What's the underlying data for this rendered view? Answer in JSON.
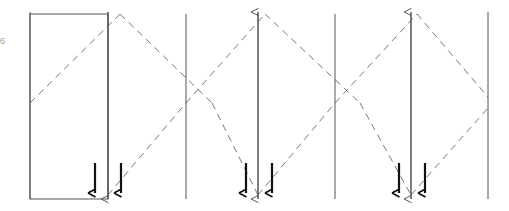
{
  "diagram": {
    "type": "line-diagram",
    "canvas": {
      "width": 509,
      "height": 211
    },
    "colors": {
      "solid_line": "#555555",
      "dashed_line": "#777777",
      "rectangle": "#555555",
      "marker": "#111111",
      "background": "#ffffff",
      "edge_label": "#9a9a9a"
    },
    "stroke_widths": {
      "solid_line": 1.0,
      "dashed_line": 1.0,
      "rectangle": 1.0,
      "marker": 2.2
    },
    "dash_pattern": "7,5",
    "edge_label_text": "6",
    "vertical_lines": [
      {
        "name": "plane-1",
        "x": 30,
        "y_top": 12,
        "y_bottom": 199,
        "arrow": "none"
      },
      {
        "name": "plane-2",
        "x": 108,
        "y_top": 12,
        "y_bottom": 199,
        "arrow": "none"
      },
      {
        "name": "plane-3",
        "x": 186,
        "y_top": 14,
        "y_bottom": 199,
        "arrow": "none"
      },
      {
        "name": "plane-4",
        "x": 258,
        "y_top": 12,
        "y_bottom": 199,
        "arrow": "up"
      },
      {
        "name": "plane-5",
        "x": 335,
        "y_top": 14,
        "y_bottom": 199,
        "arrow": "none"
      },
      {
        "name": "plane-6",
        "x": 411,
        "y_top": 12,
        "y_bottom": 199,
        "arrow": "up"
      },
      {
        "name": "plane-7",
        "x": 488,
        "y_top": 12,
        "y_bottom": 199,
        "arrow": "none"
      }
    ],
    "down_arrow_lines": [
      {
        "name": "down-plane-1",
        "x": 108,
        "y_top": 12,
        "y_bottom": 199
      },
      {
        "name": "down-plane-2",
        "x": 258,
        "y_top": 12,
        "y_bottom": 199
      },
      {
        "name": "down-plane-3",
        "x": 411,
        "y_top": 12,
        "y_bottom": 199
      }
    ],
    "rectangle": {
      "name": "left-block",
      "x": 30,
      "y": 14,
      "width": 78,
      "height": 185
    },
    "zigzag_path": {
      "name": "ray-path",
      "points": [
        {
          "x": 30,
          "y": 103
        },
        {
          "x": 120,
          "y": 14
        },
        {
          "x": 197,
          "y": 103
        },
        {
          "x": 258,
          "y": 199
        },
        {
          "x": 275,
          "y": 103
        },
        {
          "x": 335,
          "y": 103
        },
        {
          "x": 411,
          "y": 14
        },
        {
          "x": 488,
          "y": 103
        }
      ],
      "description": "Dashed rays forming repeating diamond crossings between planes"
    },
    "zigzag_segments": [
      {
        "name": "seg-up-1",
        "x1": 30,
        "y1": 103,
        "x2": 120,
        "y2": 14
      },
      {
        "name": "seg-down-1",
        "x1": 120,
        "y1": 14,
        "x2": 212,
        "y2": 103
      },
      {
        "name": "seg-down-1b",
        "x1": 212,
        "y1": 103,
        "x2": 258,
        "y2": 195
      },
      {
        "name": "seg-up-2",
        "x1": 108,
        "y1": 195,
        "x2": 186,
        "y2": 103
      },
      {
        "name": "seg-up-2b",
        "x1": 186,
        "y1": 103,
        "x2": 265,
        "y2": 14
      },
      {
        "name": "seg-down-2",
        "x1": 265,
        "y1": 14,
        "x2": 360,
        "y2": 103
      },
      {
        "name": "seg-down-2b",
        "x1": 360,
        "y1": 103,
        "x2": 411,
        "y2": 195
      },
      {
        "name": "seg-up-3",
        "x1": 258,
        "y1": 195,
        "x2": 335,
        "y2": 103
      },
      {
        "name": "seg-up-3b",
        "x1": 335,
        "y1": 103,
        "x2": 417,
        "y2": 14
      },
      {
        "name": "seg-down-3",
        "x1": 417,
        "y1": 14,
        "x2": 488,
        "y2": 97
      },
      {
        "name": "seg-up-4",
        "x1": 411,
        "y1": 195,
        "x2": 488,
        "y2": 108
      }
    ],
    "crossing_points": [
      {
        "name": "crossing-left",
        "x": 30,
        "y": 103
      },
      {
        "name": "crossing-mid-1",
        "x": 186,
        "y": 103
      },
      {
        "name": "crossing-mid-2",
        "x": 335,
        "y": 103
      },
      {
        "name": "crossing-right",
        "x": 488,
        "y": 103
      }
    ],
    "apex_points": [
      {
        "name": "apex-up-1",
        "x": 108,
        "y": 14,
        "direction": "up"
      },
      {
        "name": "apex-down-1",
        "x": 258,
        "y": 199,
        "direction": "down"
      },
      {
        "name": "apex-up-2",
        "x": 258,
        "y": 12,
        "direction": "up"
      },
      {
        "name": "apex-down-2",
        "x": 411,
        "y": 199,
        "direction": "down"
      },
      {
        "name": "apex-up-3",
        "x": 411,
        "y": 12,
        "direction": "up"
      }
    ],
    "tick_markers": [
      {
        "name": "tick-marker-1",
        "x": 95,
        "y_top": 163,
        "y_bottom": 193
      },
      {
        "name": "tick-marker-2",
        "x": 121,
        "y_top": 163,
        "y_bottom": 193
      },
      {
        "name": "tick-marker-3",
        "x": 246,
        "y_top": 163,
        "y_bottom": 193
      },
      {
        "name": "tick-marker-4",
        "x": 272,
        "y_top": 163,
        "y_bottom": 193
      },
      {
        "name": "tick-marker-5",
        "x": 399,
        "y_top": 163,
        "y_bottom": 193
      },
      {
        "name": "tick-marker-6",
        "x": 425,
        "y_top": 163,
        "y_bottom": 193
      }
    ]
  }
}
